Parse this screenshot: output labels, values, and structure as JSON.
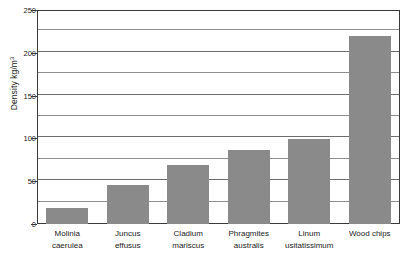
{
  "chart_data": {
    "type": "bar",
    "title": "",
    "xlabel": "",
    "ylabel": "Density kg/m",
    "ylabel_exponent": "3",
    "ylim": [
      0,
      250
    ],
    "ytick_labels": [
      "0",
      "50",
      "100",
      "150",
      "200",
      "250"
    ],
    "ytick_values": [
      0,
      50,
      100,
      150,
      200,
      250
    ],
    "gridline_values": [
      25,
      50,
      75,
      100,
      125,
      150,
      175,
      200,
      225
    ],
    "grid": true,
    "legend": "none",
    "bar_color": "#8a8a8a",
    "axis_color": "#3a3a3a",
    "categories": [
      "Molinia caerulea",
      "Juncus effusus",
      "Cladium mariscus",
      "Phragmites australis",
      "Linum usitatissimum",
      "Wood chips"
    ],
    "category_lines": [
      {
        "line1": "Molinia",
        "line2": "caerulea"
      },
      {
        "line1": "Juncus",
        "line2": "effusus"
      },
      {
        "line1": "Cladium",
        "line2": "mariscus"
      },
      {
        "line1": "Phragmites",
        "line2": "australis"
      },
      {
        "line1": "Linum",
        "line2": "usitatissimum"
      },
      {
        "line1": "Wood chips",
        "line2": ""
      }
    ],
    "values": [
      19,
      45,
      69,
      87,
      99,
      220
    ]
  }
}
